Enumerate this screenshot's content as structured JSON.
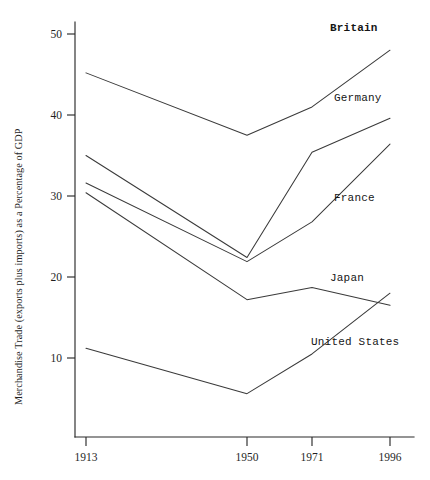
{
  "chart_data": {
    "type": "line",
    "title": "",
    "xlabel": "",
    "ylabel": "Merchandise Trade (exports plus imports) as a Percentage of GDP",
    "categories": [
      "1913",
      "1950",
      "1971",
      "1996"
    ],
    "x_tick_labels": [
      "1913",
      "1950",
      "1971",
      "1996"
    ],
    "y_tick_labels": [
      "10",
      "20",
      "30",
      "40",
      "50"
    ],
    "y_ticks": [
      10,
      20,
      30,
      40,
      50
    ],
    "ylim": [
      3,
      52
    ],
    "grid": false,
    "legend_position": "inline-right",
    "series": [
      {
        "name": "Britain",
        "values": [
          45.2,
          37.5,
          41.0,
          48.0
        ],
        "emphasis": true
      },
      {
        "name": "Germany",
        "values": [
          35.0,
          22.4,
          35.4,
          39.6
        ],
        "emphasis": false
      },
      {
        "name": "France",
        "values": [
          31.6,
          21.9,
          26.8,
          36.4
        ],
        "emphasis": false
      },
      {
        "name": "Japan",
        "values": [
          30.4,
          17.2,
          18.7,
          16.5
        ],
        "emphasis": false
      },
      {
        "name": "United States",
        "values": [
          11.2,
          5.6,
          10.5,
          18.0
        ],
        "emphasis": false
      }
    ],
    "annotations": [
      {
        "text": "Britain",
        "x": 330,
        "y": 31,
        "bold": true
      },
      {
        "text": "Germany",
        "x": 334,
        "y": 101,
        "bold": false
      },
      {
        "text": "France",
        "x": 334,
        "y": 201,
        "bold": false
      },
      {
        "text": "Japan",
        "x": 330,
        "y": 281,
        "bold": false
      },
      {
        "text": "United States",
        "x": 311,
        "y": 345,
        "bold": false
      }
    ],
    "colors": {
      "line": "#3a3a3a",
      "axis": "#2b2b2b",
      "text": "#1a1a1a",
      "background": "#ffffff"
    }
  }
}
